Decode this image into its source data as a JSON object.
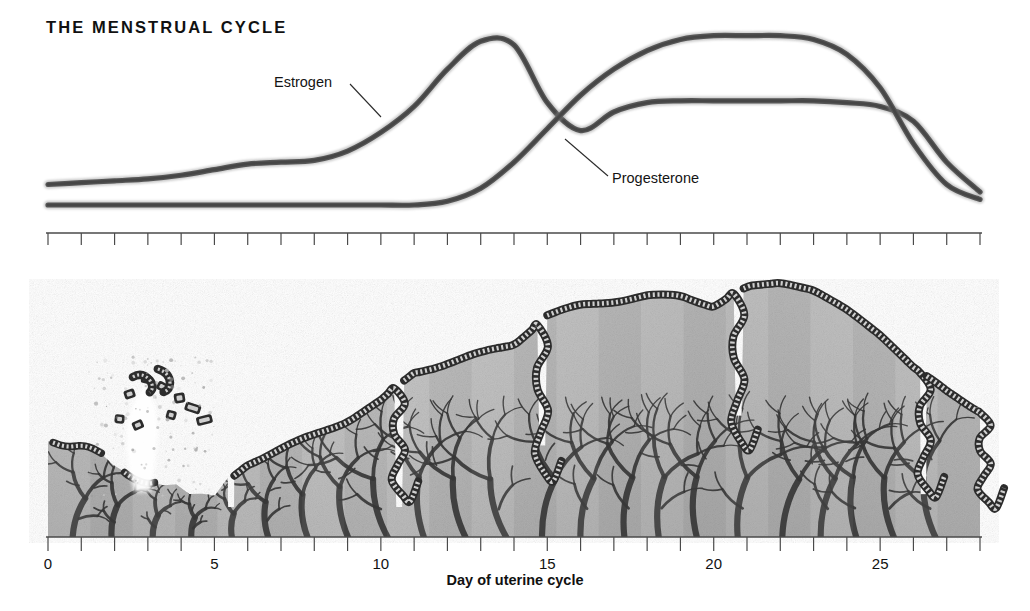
{
  "title": "THE MENSTRUAL CYCLE",
  "labels": {
    "estrogen": "Estrogen",
    "progesterone": "Progesterone"
  },
  "axis": {
    "title": "Day of uterine cycle",
    "tick_labels": [
      "0",
      "5",
      "10",
      "15",
      "20",
      "25"
    ],
    "tick_label_days": [
      0,
      5,
      10,
      15,
      20,
      25
    ],
    "min_day": 0,
    "max_day": 28,
    "tick_every": 1
  },
  "colors": {
    "curve": "#5a5a5a",
    "curve_core": "#3f3f3f",
    "leader_line": "#2b2b2b",
    "axis": "#4a4a4a",
    "text": "#111111",
    "tissue_light": "#cfcfcf",
    "tissue_mid": "#b3b3b3",
    "tissue_dark": "#8e8e8e",
    "vessel": "#3a3a3a",
    "gland": "#2e2e2e",
    "background": "#ffffff"
  },
  "chart_data": [
    {
      "type": "line",
      "title": "THE MENSTRUAL CYCLE",
      "xlabel": "Day of uterine cycle",
      "ylabel": "",
      "xlim": [
        0,
        28
      ],
      "ylim": [
        0,
        100
      ],
      "grid": false,
      "legend": "inline-labels",
      "x": [
        0,
        1,
        2,
        3,
        4,
        5,
        6,
        7,
        8,
        9,
        10,
        11,
        12,
        13,
        14,
        15,
        16,
        17,
        18,
        19,
        20,
        21,
        22,
        23,
        24,
        25,
        26,
        27,
        28
      ],
      "series": [
        {
          "name": "Estrogen",
          "values": [
            18,
            19,
            20,
            21,
            23,
            26,
            29,
            30,
            31,
            36,
            46,
            60,
            80,
            95,
            93,
            62,
            47,
            57,
            62,
            63,
            63,
            63,
            63,
            63,
            62,
            60,
            52,
            30,
            14
          ],
          "annotations": [
            {
              "text": "first small rise plateau",
              "day_range": [
                5,
                8
              ]
            },
            {
              "text": "ovulatory peak",
              "day": 13
            },
            {
              "text": "post-ovulatory dip",
              "day": 16
            },
            {
              "text": "luteal plateau",
              "day_range": [
                18,
                24
              ]
            },
            {
              "text": "late luteal fall",
              "day_range": [
                25,
                28
              ]
            }
          ]
        },
        {
          "name": "Progesterone",
          "values": [
            7,
            7,
            7,
            7,
            7,
            7,
            7,
            7,
            7,
            7,
            7,
            7,
            9,
            16,
            30,
            48,
            66,
            80,
            90,
            96,
            98,
            98,
            98,
            96,
            88,
            70,
            40,
            18,
            10
          ],
          "annotations": [
            {
              "text": "flat baseline follicular phase",
              "day_range": [
                0,
                12
              ]
            },
            {
              "text": "steep luteal rise",
              "day_range": [
                13,
                19
              ]
            },
            {
              "text": "luteal plateau",
              "day_range": [
                19,
                23
              ]
            },
            {
              "text": "sharp premenstrual fall",
              "day_range": [
                24,
                28
              ]
            }
          ]
        }
      ]
    },
    {
      "type": "area",
      "title": "Endometrial lining thickness",
      "xlabel": "Day of uterine cycle",
      "ylabel": "Endometrium thickness",
      "xlim": [
        0,
        28
      ],
      "grid": false,
      "x": [
        0,
        1,
        2,
        3,
        4,
        5,
        6,
        7,
        8,
        9,
        10,
        11,
        12,
        13,
        14,
        15,
        16,
        17,
        18,
        19,
        20,
        21,
        22,
        23,
        24,
        25,
        26,
        27,
        28
      ],
      "values": [
        40,
        38,
        30,
        22,
        20,
        18,
        30,
        36,
        42,
        48,
        56,
        68,
        72,
        76,
        80,
        92,
        96,
        98,
        100,
        100,
        96,
        104,
        104,
        100,
        92,
        82,
        70,
        60,
        52
      ],
      "annotations": [
        {
          "text": "menstruation: lining sloughs, tissue fragments shed",
          "day_range": [
            0,
            5
          ]
        },
        {
          "text": "proliferative phase: lining rebuilds and thickens",
          "day_range": [
            6,
            14
          ]
        },
        {
          "text": "secretory phase: maximum thickness, coiled glands",
          "day_range": [
            15,
            24
          ]
        },
        {
          "text": "late secretory: lining regresses",
          "day_range": [
            25,
            28
          ]
        }
      ]
    }
  ]
}
